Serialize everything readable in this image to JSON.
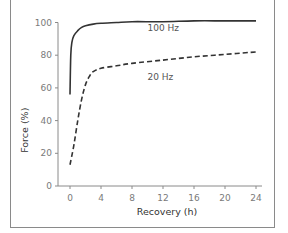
{
  "chart_data": {
    "type": "line",
    "title": "",
    "xlabel": "Recovery (h)",
    "ylabel": "Force (%)",
    "xlim": [
      0,
      24
    ],
    "ylim": [
      0,
      100
    ],
    "xticks": [
      0,
      4,
      8,
      12,
      16,
      20,
      24
    ],
    "yticks": [
      0,
      20,
      40,
      60,
      80,
      100
    ],
    "grid": false,
    "legend": "inline labels",
    "series": [
      {
        "name": "100 Hz",
        "style": "solid",
        "color": "#333333",
        "x": [
          0,
          0.1,
          0.25,
          0.5,
          1,
          1.5,
          2,
          3,
          4,
          6,
          8,
          12,
          16,
          20,
          24
        ],
        "y": [
          56,
          80,
          88,
          92,
          95,
          97,
          98,
          99,
          99.5,
          100,
          100.5,
          100.5,
          101,
          101,
          101
        ]
      },
      {
        "name": "20 Hz",
        "style": "dashed",
        "color": "#333333",
        "x": [
          0,
          0.5,
          1,
          1.5,
          2,
          2.5,
          3,
          4,
          6,
          8,
          12,
          16,
          20,
          24
        ],
        "y": [
          13,
          25,
          40,
          53,
          62,
          67,
          70,
          72,
          73.5,
          75,
          77,
          79,
          80.5,
          82
        ]
      }
    ],
    "annotations": [
      {
        "text": "100 Hz",
        "x": 10,
        "y": 95
      },
      {
        "text": "20 Hz",
        "x": 10,
        "y": 65
      }
    ]
  }
}
